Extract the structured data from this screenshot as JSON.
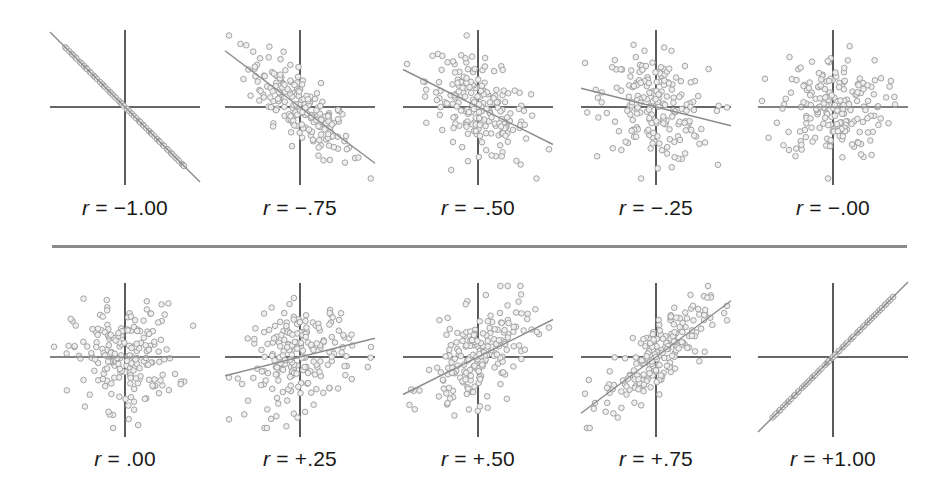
{
  "chart_data": {
    "type": "scatter",
    "title": "",
    "rows": [
      {
        "panels": [
          {
            "label_var": "r",
            "label_eq": "=",
            "label_value": "−1.00",
            "r": -1.0,
            "cx": 125
          },
          {
            "label_var": "r",
            "label_eq": "=",
            "label_value": "−.75",
            "r": -0.75,
            "cx": 300
          },
          {
            "label_var": "r",
            "label_eq": "=",
            "label_value": "−.50",
            "r": -0.5,
            "cx": 478
          },
          {
            "label_var": "r",
            "label_eq": "=",
            "label_value": "−.25",
            "r": -0.25,
            "cx": 656
          },
          {
            "label_var": "r",
            "label_eq": "=",
            "label_value": "−.00",
            "r": 0.0,
            "cx": 833
          }
        ],
        "axis_y": 107,
        "axis_top": 30,
        "axis_bottom": 185,
        "label_y": 196
      },
      {
        "panels": [
          {
            "label_var": "r",
            "label_eq": "=",
            "label_value": ".00",
            "r": 0.0,
            "cx": 125
          },
          {
            "label_var": "r",
            "label_eq": "=",
            "label_value": "+.25",
            "r": 0.25,
            "cx": 300
          },
          {
            "label_var": "r",
            "label_eq": "=",
            "label_value": "+.50",
            "r": 0.5,
            "cx": 478
          },
          {
            "label_var": "r",
            "label_eq": "=",
            "label_value": "+.75",
            "r": 0.75,
            "cx": 656
          },
          {
            "label_var": "r",
            "label_eq": "=",
            "label_value": "+1.00",
            "r": 1.0,
            "cx": 833
          }
        ],
        "axis_y": 357,
        "axis_top": 283,
        "axis_bottom": 437,
        "label_y": 447
      }
    ],
    "points_per_panel": 200,
    "axis_half_width": 75,
    "colors": {
      "axis": "#333333",
      "regression": "#8c8c8c",
      "point_stroke": "#9a9a9a",
      "point_fill": "#efefef",
      "separator": "#8a8a8a"
    },
    "grid": false,
    "legend": null
  }
}
